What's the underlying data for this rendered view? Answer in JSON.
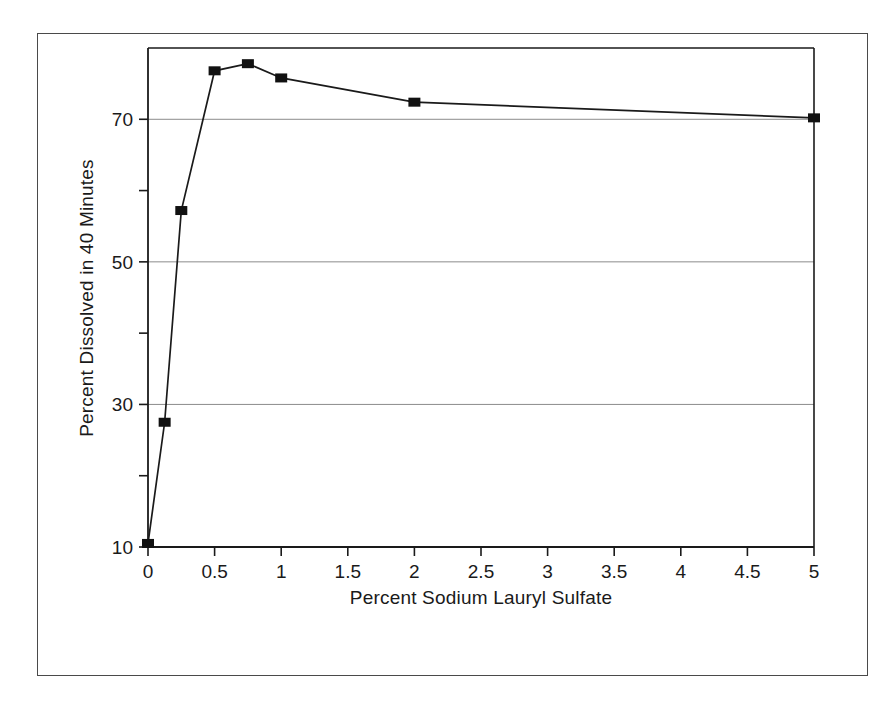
{
  "figure": {
    "background_color": "#ffffff",
    "frame_color": "#4a4a4a",
    "line_color": "#1a1a1a",
    "marker_color": "#111111",
    "grid_color": "#8c8c8c"
  },
  "chart_data": {
    "type": "line",
    "title": "",
    "subtitle": "",
    "xlabel": "Percent Sodium Lauryl Sulfate",
    "ylabel": "Percent Dissolved in 40 Minutes",
    "xlim": [
      0,
      5
    ],
    "ylim": [
      10,
      80
    ],
    "xticks": [
      0,
      0.5,
      1,
      1.5,
      2,
      2.5,
      3,
      3.5,
      4,
      4.5,
      5
    ],
    "xticklabels": [
      "0",
      "0.5",
      "1",
      "1.5",
      "2",
      "2.5",
      "3",
      "3.5",
      "4",
      "4.5",
      "5"
    ],
    "yticks": [
      10,
      20,
      30,
      40,
      50,
      60,
      70
    ],
    "yticklabels": [
      "10",
      "",
      "30",
      "",
      "50",
      "",
      "70"
    ],
    "ymajorticks": [
      10,
      30,
      50,
      70
    ],
    "ymajorticklabels": [
      "10",
      "30",
      "50",
      "70"
    ],
    "yminorticks": [
      20,
      40,
      60
    ],
    "grid": {
      "x": false,
      "y": true,
      "which": "major"
    },
    "legend": {
      "visible": false,
      "position": "none"
    },
    "marker": "square",
    "x": [
      0,
      0.125,
      0.25,
      0.5,
      0.75,
      1,
      2,
      5
    ],
    "y": [
      10.5,
      27.5,
      57.2,
      76.8,
      77.8,
      75.8,
      72.4,
      70.2
    ],
    "series": [
      {
        "name": "Percent Dissolved in 40 Minutes",
        "points": [
          {
            "x": 0,
            "y": 10.5
          },
          {
            "x": 0.125,
            "y": 27.5
          },
          {
            "x": 0.25,
            "y": 57.2
          },
          {
            "x": 0.5,
            "y": 76.8
          },
          {
            "x": 0.75,
            "y": 77.8
          },
          {
            "x": 1,
            "y": 75.8
          },
          {
            "x": 2,
            "y": 72.4
          },
          {
            "x": 5,
            "y": 70.2
          }
        ]
      }
    ]
  }
}
